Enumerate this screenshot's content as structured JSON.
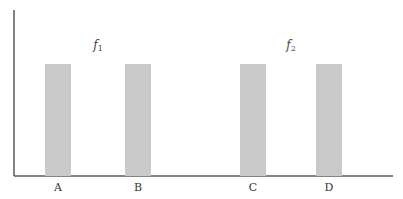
{
  "chart_data": {
    "type": "bar",
    "title": "",
    "xlabel": "",
    "ylabel": "",
    "categories": [
      "A",
      "B",
      "C",
      "D"
    ],
    "values": [
      1,
      1,
      1,
      1
    ],
    "ylim": [
      0,
      1.25
    ],
    "grid": false,
    "bar_color": "#c9c9c9",
    "axis_color": "#5a5a5a",
    "groups": [
      {
        "label": "f",
        "subscript": "1",
        "categories": [
          "A",
          "B"
        ]
      },
      {
        "label": "f",
        "subscript": "2",
        "categories": [
          "C",
          "D"
        ]
      }
    ]
  }
}
